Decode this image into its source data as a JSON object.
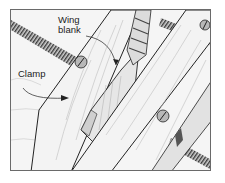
{
  "figure": {
    "labels": {
      "wing_line1": "Wing",
      "wing_line2": "blank",
      "clamp": "Clamp"
    },
    "colors": {
      "wood": "#f2f2f2",
      "line": "#2a2a2a",
      "shade": "#9a9a9a",
      "frame": "#6a6a6a"
    }
  }
}
